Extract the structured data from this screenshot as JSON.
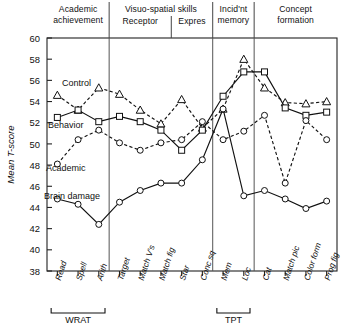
{
  "chart_data": {
    "type": "line",
    "title": "",
    "ylabel": "Mean T-score",
    "xlabel": "",
    "ylim": [
      38,
      60
    ],
    "yticks": [
      38,
      40,
      42,
      44,
      46,
      48,
      50,
      52,
      54,
      56,
      58,
      60
    ],
    "grid": false,
    "legend": "inline-labels",
    "categories": [
      "Read",
      "Spell",
      "Arith",
      "Target",
      "Match V's",
      "Match fig",
      "Star",
      "Conc sq",
      "Mem",
      "Loc",
      "Cat",
      "Match pic",
      "Color form",
      "Prog fig"
    ],
    "column_groups": [
      {
        "label": "Academic achievement",
        "lines": [
          "Academic",
          "achievement"
        ],
        "start": 0,
        "end": 2
      },
      {
        "label": "Visuo-spatial skills",
        "lines": [
          "Visuo-spatial skills"
        ],
        "start": 3,
        "end": 7,
        "sub": [
          {
            "label": "Receptor",
            "start": 3,
            "end": 5
          },
          {
            "label": "Expres",
            "start": 6,
            "end": 7
          }
        ]
      },
      {
        "label": "Incid'nt memory",
        "lines": [
          "Incid'nt",
          "memory"
        ],
        "start": 8,
        "end": 9
      },
      {
        "label": "Concept formation",
        "lines": [
          "Concept",
          "formation"
        ],
        "start": 10,
        "end": 13
      }
    ],
    "x_brackets": [
      {
        "label": "WRAT",
        "start": 0,
        "end": 2
      },
      {
        "label": "TPT",
        "start": 8,
        "end": 9
      }
    ],
    "series": [
      {
        "name": "Control",
        "marker": "triangle",
        "line": "dashed",
        "values": [
          54.6,
          53.2,
          55.3,
          54.7,
          53.2,
          51.9,
          54.2,
          51.5,
          53.3,
          58.0,
          55.3,
          53.9,
          53.8,
          54.0
        ]
      },
      {
        "name": "Behavior",
        "marker": "square",
        "line": "solid",
        "values": [
          52.5,
          53.2,
          52.1,
          52.6,
          52.1,
          51.3,
          49.4,
          51.3,
          54.5,
          56.8,
          56.8,
          53.4,
          52.7,
          53.0
        ]
      },
      {
        "name": "Academic",
        "marker": "circle",
        "line": "dashed",
        "values": [
          48.1,
          50.4,
          51.3,
          50.1,
          49.4,
          50.1,
          50.4,
          52.1,
          50.4,
          51.2,
          52.7,
          46.3,
          52.2,
          50.4
        ]
      },
      {
        "name": "Brain damage",
        "marker": "circle",
        "line": "solid",
        "values": [
          44.8,
          44.3,
          42.4,
          44.5,
          45.6,
          46.3,
          46.3,
          48.5,
          53.3,
          45.1,
          45.6,
          44.8,
          43.9,
          44.6
        ]
      }
    ],
    "series_labels": [
      {
        "name": "Control",
        "x": 62,
        "y": 86
      },
      {
        "name": "Behavior",
        "x": 48,
        "y": 128
      },
      {
        "name": "Academic",
        "x": 46,
        "y": 171
      },
      {
        "name": "Brain damage",
        "x": 44,
        "y": 199
      }
    ]
  }
}
